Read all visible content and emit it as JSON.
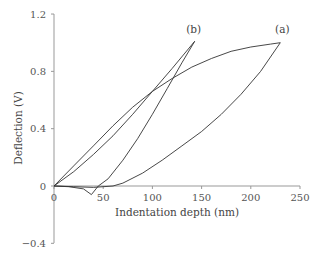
{
  "chart_data": {
    "type": "line",
    "title": "",
    "xlabel": "Indentation depth (nm)",
    "ylabel": "Deflection (V)",
    "xlim": [
      0,
      250
    ],
    "ylim": [
      -0.4,
      1.2
    ],
    "xticks": [
      "0",
      "50",
      "100",
      "150",
      "200",
      "250"
    ],
    "yticks": [
      "1.2",
      "0.8",
      "0.4",
      "0",
      "−0.4"
    ],
    "grid": false,
    "annotations": [
      {
        "text": "(a)",
        "x": 232,
        "y": 1.07
      },
      {
        "text": "(b)",
        "x": 142,
        "y": 1.07
      }
    ],
    "series": [
      {
        "name": "(a) loading",
        "x": [
          0,
          20,
          40,
          60,
          80,
          100,
          120,
          140,
          160,
          180,
          200,
          220,
          230
        ],
        "y": [
          0,
          0.14,
          0.28,
          0.42,
          0.55,
          0.66,
          0.75,
          0.83,
          0.89,
          0.94,
          0.97,
          0.99,
          1.0
        ]
      },
      {
        "name": "(a) unloading",
        "x": [
          230,
          210,
          190,
          170,
          150,
          130,
          110,
          90,
          70,
          60,
          40,
          20,
          0
        ],
        "y": [
          1.0,
          0.8,
          0.64,
          0.5,
          0.38,
          0.28,
          0.18,
          0.09,
          0.02,
          0,
          -0.01,
          -0.005,
          0
        ]
      },
      {
        "name": "(b) loading",
        "x": [
          0,
          20,
          40,
          60,
          80,
          100,
          120,
          143
        ],
        "y": [
          0,
          0.1,
          0.22,
          0.35,
          0.5,
          0.66,
          0.82,
          1.01
        ]
      },
      {
        "name": "(b) unloading",
        "x": [
          143,
          130,
          115,
          100,
          85,
          70,
          55,
          45,
          38,
          30,
          15,
          0
        ],
        "y": [
          1.01,
          0.86,
          0.68,
          0.5,
          0.33,
          0.18,
          0.05,
          0,
          -0.06,
          -0.02,
          -0.005,
          0
        ]
      }
    ]
  }
}
